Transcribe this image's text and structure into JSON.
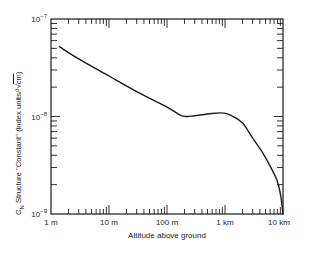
{
  "chart_data": {
    "type": "line",
    "title": "",
    "xlabel": "Altitude above ground",
    "ylabel": "C_N Structure ''Constant'' (index units/³√cm)",
    "ylabel_parts": {
      "c": "C",
      "sub": "N",
      "rest": " Structure ''Constant'' (index units/",
      "root": "³√",
      "unit": "cm",
      "close": ")"
    },
    "x_scale": "log",
    "y_scale": "log",
    "xlim_m": [
      1,
      10000
    ],
    "ylim": [
      1e-09,
      1e-07
    ],
    "x_ticks": [
      {
        "value_m": 1,
        "label": "1 m"
      },
      {
        "value_m": 10,
        "label": "10 m"
      },
      {
        "value_m": 100,
        "label": "100 m"
      },
      {
        "value_m": 1000,
        "label": "1 km"
      },
      {
        "value_m": 10000,
        "label": "10 km"
      }
    ],
    "y_ticks": [
      {
        "value": 1e-07,
        "base": "10",
        "exp": "−7"
      },
      {
        "value": 1e-08,
        "base": "10",
        "exp": "−8"
      },
      {
        "value": 1e-09,
        "base": "10",
        "exp": "−9"
      }
    ],
    "grid": false,
    "legend": null,
    "series": [
      {
        "name": "C_N structure constant",
        "x_m": [
          1.4,
          3,
          10,
          30,
          100,
          170,
          220,
          300,
          500,
          890,
          1300,
          2000,
          3000,
          4500,
          6000,
          7900,
          9200,
          10000
        ],
        "values": [
          5.2e-08,
          3.9e-08,
          2.6e-08,
          1.8e-08,
          1.25e-08,
          1.03e-08,
          1e-08,
          1.02e-08,
          1.06e-08,
          1.09e-08,
          1.02e-08,
          8.6e-09,
          6e-09,
          4.2e-09,
          3.1e-09,
          2.2e-09,
          1.5e-09,
          1e-09
        ]
      }
    ]
  }
}
